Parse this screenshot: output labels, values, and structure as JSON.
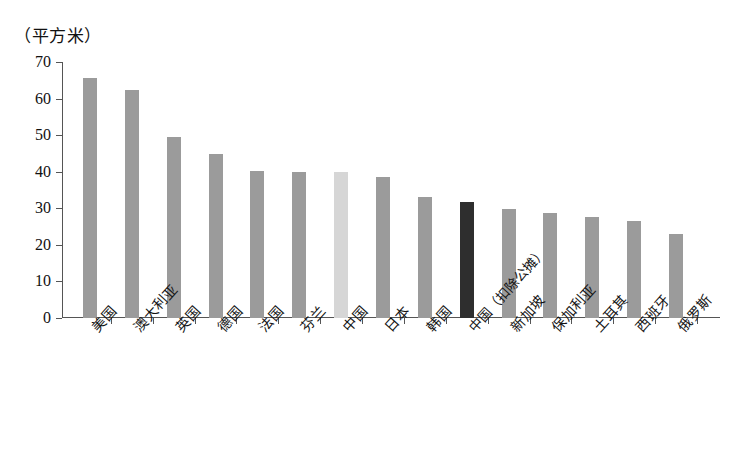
{
  "chart_data": {
    "type": "bar",
    "title": "（平方米）",
    "subtitle": "",
    "xlabel": "",
    "ylabel": "",
    "ylim": [
      0,
      70
    ],
    "ytick_step": 10,
    "yticks": [
      0,
      10,
      20,
      30,
      40,
      50,
      60,
      70
    ],
    "grid": false,
    "legend": "none",
    "unit": "平方米",
    "categories": [
      "美国",
      "澳大利亚",
      "英国",
      "德国",
      "法国",
      "芬兰",
      "中国",
      "日本",
      "韩国",
      "中国（扣除公摊）",
      "新加坡",
      "保加利亚",
      "土耳其",
      "西班牙",
      "俄罗斯"
    ],
    "values": [
      65.5,
      62.4,
      49.5,
      44.8,
      40.1,
      40.0,
      39.8,
      38.6,
      33.0,
      31.6,
      29.9,
      28.6,
      27.7,
      26.4,
      23.1
    ],
    "bar_styles": [
      "normal",
      "normal",
      "normal",
      "normal",
      "normal",
      "normal",
      "light",
      "normal",
      "normal",
      "dark",
      "normal",
      "normal",
      "normal",
      "normal",
      "normal"
    ],
    "colors": {
      "bar_normal": "#9b9b9b",
      "bar_light": "#d6d6d6",
      "bar_dark": "#2e2e2e",
      "axis": "#555555",
      "text": "#111111",
      "background": "#ffffff"
    }
  }
}
